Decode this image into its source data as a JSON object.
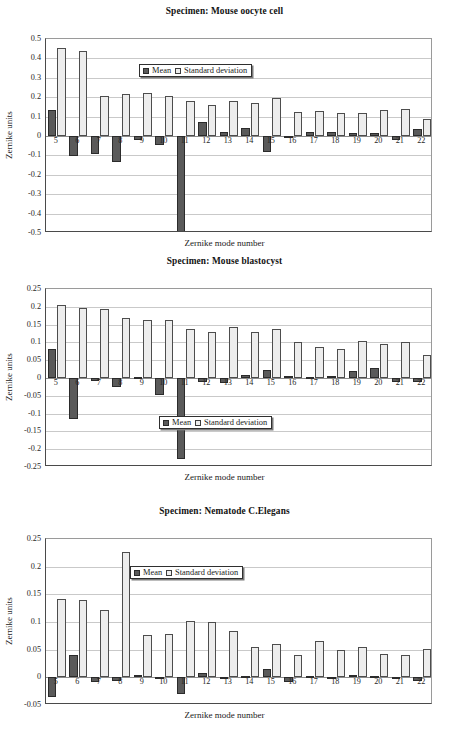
{
  "figure": {
    "legend": {
      "mean_label": "Mean",
      "sd_label": "Standard deviation"
    },
    "axis": {
      "ylabel": "Zernike units",
      "xlabel": "Zernike mode number"
    }
  },
  "chart_data": [
    {
      "type": "bar",
      "title": "Specimen: Mouse oocyte cell",
      "xlabel": "Zernike mode number",
      "ylabel": "Zernike units",
      "ylim": [
        -0.5,
        0.5
      ],
      "yticks": [
        "0.5",
        "0.4",
        "0.3",
        "0.2",
        "0.1",
        "0",
        "-0.1",
        "-0.2",
        "-0.3",
        "-0.4",
        "-0.5"
      ],
      "ytick_values": [
        0.5,
        0.4,
        0.3,
        0.2,
        0.1,
        0,
        -0.1,
        -0.2,
        -0.3,
        -0.4,
        -0.5
      ],
      "grid": true,
      "legend_position": "top-center",
      "categories": [
        "5",
        "6",
        "7",
        "8",
        "9",
        "10",
        "11",
        "12",
        "13",
        "14",
        "15",
        "16",
        "17",
        "18",
        "19",
        "20",
        "21",
        "22"
      ],
      "series": [
        {
          "name": "Mean",
          "values": [
            0.135,
            -0.105,
            -0.093,
            -0.135,
            -0.022,
            -0.045,
            -0.497,
            0.072,
            0.022,
            0.042,
            -0.082,
            -0.008,
            0.021,
            0.022,
            0.013,
            0.013,
            -0.021,
            0.037
          ]
        },
        {
          "name": "Standard deviation",
          "values": [
            0.456,
            0.436,
            0.208,
            0.215,
            0.223,
            0.208,
            0.178,
            0.159,
            0.178,
            0.171,
            0.195,
            0.123,
            0.128,
            0.118,
            0.117,
            0.133,
            0.139,
            0.087
          ]
        }
      ]
    },
    {
      "type": "bar",
      "title": "Specimen: Mouse blastocyst",
      "xlabel": "Zernike mode number",
      "ylabel": "Zernike units",
      "ylim": [
        -0.25,
        0.25
      ],
      "yticks": [
        "0.25",
        "0.2",
        "0.15",
        "0.1",
        "0.05",
        "0",
        "-0.05",
        "-0.1",
        "-0.15",
        "-0.2",
        "-0.25"
      ],
      "ytick_values": [
        0.25,
        0.2,
        0.15,
        0.1,
        0.05,
        0,
        -0.05,
        -0.1,
        -0.15,
        -0.2,
        -0.25
      ],
      "grid": true,
      "legend_position": "bottom-center",
      "categories": [
        "5",
        "6",
        "7",
        "8",
        "9",
        "10",
        "11",
        "12",
        "13",
        "14",
        "15",
        "16",
        "17",
        "18",
        "19",
        "20",
        "21",
        "22"
      ],
      "series": [
        {
          "name": "Mean",
          "values": [
            0.081,
            -0.114,
            -0.008,
            -0.024,
            0.0,
            -0.047,
            -0.227,
            -0.011,
            -0.014,
            0.009,
            0.022,
            0.006,
            0.001,
            0.006,
            0.019,
            0.027,
            -0.012,
            -0.012
          ]
        },
        {
          "name": "Standard deviation",
          "values": [
            0.204,
            0.197,
            0.193,
            0.168,
            0.163,
            0.164,
            0.139,
            0.129,
            0.144,
            0.13,
            0.138,
            0.1,
            0.088,
            0.082,
            0.103,
            0.095,
            0.102,
            0.066
          ]
        }
      ]
    },
    {
      "type": "bar",
      "title": "Specimen: Nematode C.Elegans",
      "xlabel": "Zernike mode number",
      "ylabel": "Zernike units",
      "ylim": [
        -0.05,
        0.25
      ],
      "yticks": [
        "0.25",
        "0.2",
        "0.15",
        "0.1",
        "0.05",
        "0",
        "-0.05"
      ],
      "ytick_values": [
        0.25,
        0.2,
        0.15,
        0.1,
        0.05,
        0,
        -0.05
      ],
      "grid": true,
      "legend_position": "top-center",
      "categories": [
        "5",
        "6",
        "7",
        "8",
        "9",
        "10",
        "11",
        "12",
        "13",
        "14",
        "15",
        "16",
        "17",
        "18",
        "19",
        "20",
        "21",
        "22"
      ],
      "series": [
        {
          "name": "Mean",
          "values": [
            -0.036,
            0.041,
            -0.008,
            -0.007,
            0.004,
            -0.003,
            -0.03,
            0.008,
            -0.002,
            0.001,
            0.015,
            -0.009,
            0.001,
            -0.001,
            0.005,
            0.0,
            -0.001,
            -0.006
          ]
        },
        {
          "name": "Standard deviation",
          "values": [
            0.142,
            0.139,
            0.122,
            0.227,
            0.077,
            0.078,
            0.101,
            0.1,
            0.083,
            0.054,
            0.061,
            0.04,
            0.066,
            0.05,
            0.054,
            0.042,
            0.041,
            0.051
          ]
        }
      ]
    }
  ],
  "colors": {
    "mean_fill": "#5a5a5a",
    "mean_border": "#2b2b2b",
    "sd_fill": "#ededed",
    "sd_border": "#4d4d4d",
    "grid": "#c9c9c9",
    "axis": "#4a4a4a"
  }
}
